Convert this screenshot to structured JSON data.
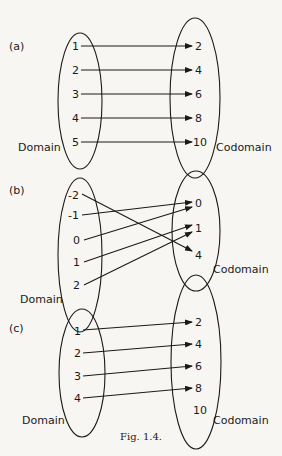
{
  "figure": {
    "caption": "Fig. 1.4.",
    "panels": [
      {
        "label": "(a)",
        "domain_label": "Domain",
        "codomain_label": "Codomain",
        "domain": [
          "1",
          "2",
          "3",
          "4",
          "5"
        ],
        "codomain": [
          "2",
          "4",
          "6",
          "8",
          "10"
        ],
        "mappings": [
          [
            "1",
            "2"
          ],
          [
            "2",
            "4"
          ],
          [
            "3",
            "6"
          ],
          [
            "4",
            "8"
          ],
          [
            "5",
            "10"
          ]
        ]
      },
      {
        "label": "(b)",
        "domain_label": "Domain",
        "codomain_label": "Codomain",
        "domain": [
          "-2",
          "-1",
          "0",
          "1",
          "2"
        ],
        "codomain": [
          "0",
          "1",
          "4"
        ],
        "mappings": [
          [
            "-2",
            "4"
          ],
          [
            "-1",
            "0"
          ],
          [
            "0",
            "0"
          ],
          [
            "1",
            "1"
          ],
          [
            "2",
            "1"
          ]
        ]
      },
      {
        "label": "(c)",
        "domain_label": "Domain",
        "codomain_label": "Codomain",
        "domain": [
          "1",
          "2",
          "3",
          "4"
        ],
        "codomain": [
          "2",
          "4",
          "6",
          "8",
          "10"
        ],
        "mappings": [
          [
            "1",
            "2"
          ],
          [
            "2",
            "4"
          ],
          [
            "3",
            "6"
          ],
          [
            "4",
            "8"
          ]
        ]
      }
    ]
  }
}
